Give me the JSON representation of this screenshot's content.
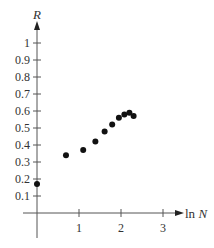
{
  "chart_data": {
    "type": "scatter",
    "title": "",
    "xlabel": "ln N",
    "ylabel": "R",
    "xlim": [
      0,
      3
    ],
    "ylim": [
      0,
      1
    ],
    "grid": false,
    "legend": null,
    "x_ticks": [
      {
        "value": 1,
        "label": "1"
      },
      {
        "value": 2,
        "label": "2"
      },
      {
        "value": 3,
        "label": "3"
      }
    ],
    "y_ticks": [
      {
        "value": 0.1,
        "label": "0.1"
      },
      {
        "value": 0.2,
        "label": "0.2"
      },
      {
        "value": 0.3,
        "label": "0.3"
      },
      {
        "value": 0.4,
        "label": "0.4"
      },
      {
        "value": 0.5,
        "label": "0.5"
      },
      {
        "value": 0.6,
        "label": "0.6"
      },
      {
        "value": 0.7,
        "label": "0.7"
      },
      {
        "value": 0.8,
        "label": "0.8"
      },
      {
        "value": 0.9,
        "label": "0.9"
      },
      {
        "value": 1,
        "label": "1"
      }
    ],
    "series": [
      {
        "name": "R vs ln N",
        "points": [
          {
            "x": 0.0,
            "y": 0.17
          },
          {
            "x": 0.69,
            "y": 0.34
          },
          {
            "x": 1.1,
            "y": 0.37
          },
          {
            "x": 1.39,
            "y": 0.42
          },
          {
            "x": 1.61,
            "y": 0.48
          },
          {
            "x": 1.79,
            "y": 0.52
          },
          {
            "x": 1.95,
            "y": 0.56
          },
          {
            "x": 2.08,
            "y": 0.58
          },
          {
            "x": 2.2,
            "y": 0.59
          },
          {
            "x": 2.3,
            "y": 0.57
          }
        ]
      }
    ]
  },
  "style": {
    "axis_color": "#555555",
    "point_color": "#111111",
    "text_color": "#333333"
  }
}
